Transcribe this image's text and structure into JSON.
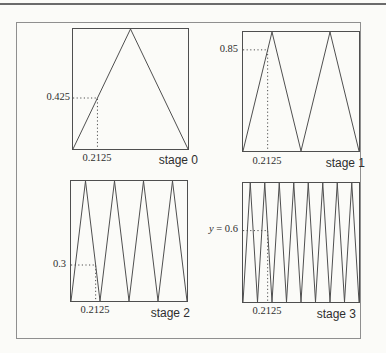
{
  "style": {
    "background": "#fbfbf8",
    "line_color": "#4f4f4f",
    "frame_color": "#8f8f8f",
    "text_color": "#2e2e2e"
  },
  "chart_data": [
    {
      "type": "line",
      "stage_label": "stage 0",
      "tent_count": 1,
      "x_range": [
        0,
        1
      ],
      "y_range": [
        0,
        1
      ],
      "vertices_x": [
        0,
        0.5,
        1
      ],
      "vertices_y": [
        0,
        1,
        0
      ],
      "marker": {
        "x": 0.2125,
        "y": 0.425,
        "x_label": "0.2125",
        "y_label": "0.425"
      }
    },
    {
      "type": "line",
      "stage_label": "stage 1",
      "tent_count": 2,
      "x_range": [
        0,
        1
      ],
      "y_range": [
        0,
        1
      ],
      "vertices_x": [
        0,
        0.25,
        0.5,
        0.75,
        1
      ],
      "vertices_y": [
        0,
        1,
        0,
        1,
        0
      ],
      "marker": {
        "x": 0.2125,
        "y": 0.85,
        "x_label": "0.2125",
        "y_label": "0.85"
      }
    },
    {
      "type": "line",
      "stage_label": "stage 2",
      "tent_count": 4,
      "x_range": [
        0,
        1
      ],
      "y_range": [
        0,
        1
      ],
      "vertices_x": [
        0,
        0.125,
        0.25,
        0.375,
        0.5,
        0.625,
        0.75,
        0.875,
        1
      ],
      "vertices_y": [
        0,
        1,
        0,
        1,
        0,
        1,
        0,
        1,
        0
      ],
      "marker": {
        "x": 0.2125,
        "y": 0.3,
        "x_label": "0.2125",
        "y_label": "0.3"
      }
    },
    {
      "type": "line",
      "stage_label": "stage 3",
      "tent_count": 8,
      "x_range": [
        0,
        1
      ],
      "y_range": [
        0,
        1
      ],
      "vertices_x": [
        0,
        0.0625,
        0.125,
        0.1875,
        0.25,
        0.3125,
        0.375,
        0.4375,
        0.5,
        0.5625,
        0.625,
        0.6875,
        0.75,
        0.8125,
        0.875,
        0.9375,
        1
      ],
      "vertices_y": [
        0,
        1,
        0,
        1,
        0,
        1,
        0,
        1,
        0,
        1,
        0,
        1,
        0,
        1,
        0,
        1,
        0
      ],
      "marker": {
        "x": 0.2125,
        "y": 0.6,
        "x_label": "0.2125",
        "y_label": "y = 0.6"
      }
    }
  ]
}
